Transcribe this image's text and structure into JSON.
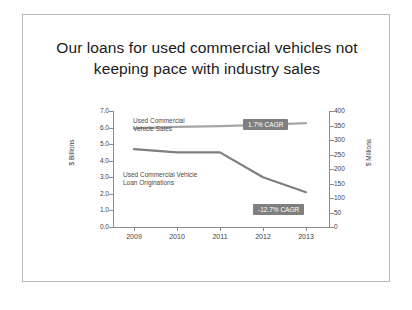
{
  "slide": {
    "title": "Our loans for used commercial vehicles not keeping pace with industry sales"
  },
  "chart_data": {
    "type": "line",
    "title": "Our loans for used commercial vehicles not keeping pace with industry sales",
    "xlabel": "",
    "ylabel": "$ Billions",
    "y2label": "$ Millions",
    "categories": [
      "2009",
      "2010",
      "2011",
      "2012",
      "2013"
    ],
    "x_tick_labels": [
      "2009",
      "2010",
      "2011",
      "2012",
      "2013"
    ],
    "y_tick_labels": [
      "0.0",
      "1.0",
      "2.0",
      "3.0",
      "4.0",
      "5.0",
      "6.0",
      "7.0"
    ],
    "y2_tick_labels": [
      "0",
      "50",
      "100",
      "150",
      "200",
      "250",
      "300",
      "350",
      "400"
    ],
    "ylim": [
      0.0,
      7.0
    ],
    "y2lim": [
      0,
      400
    ],
    "grid": false,
    "legend": "inline-labels",
    "series": [
      {
        "name": "Used Commercial Vehicle Sales",
        "axis": "right",
        "unit": "$ Millions",
        "values": [
          340,
          345,
          348,
          352,
          358
        ],
        "color": "#a6a6a6",
        "annotation": "1.7% CAGR"
      },
      {
        "name": "Used Commercial Vehicle Loan Originations",
        "axis": "left",
        "unit": "$ Billions",
        "values": [
          4.7,
          4.5,
          4.5,
          3.0,
          2.1
        ],
        "color": "#7f7f7f",
        "annotation": "-12.7% CAGR"
      }
    ],
    "annotations": [
      {
        "text": "Used Commercial Vehicle Sales",
        "kind": "series-label"
      },
      {
        "text": "Used Commercial Vehicle Loan Originations",
        "kind": "series-label"
      },
      {
        "text": "1.7% CAGR",
        "kind": "badge"
      },
      {
        "text": "-12.7% CAGR",
        "kind": "badge"
      }
    ]
  },
  "labels": {
    "series_sales": "Used Commercial Vehicle Sales",
    "series_originations": "Used Commercial Vehicle Loan Originations",
    "badge_sales": "1.7% CAGR",
    "badge_originations": "-12.7% CAGR",
    "axis_left_title": "$ Billions",
    "axis_right_title": "$ Millions"
  }
}
